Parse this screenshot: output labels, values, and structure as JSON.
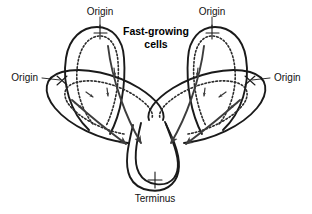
{
  "figure": {
    "title": "Fast-growing cells",
    "caption_terminus": "Terminus",
    "background_color": "#ffffff",
    "stroke_color": "#1a1a1a",
    "dashed_stroke_color": "#2b2b2b",
    "arrow_color": "#3d3d3d"
  },
  "labels": {
    "origin_top_left": "Origin",
    "origin_top_right": "Origin",
    "origin_left": "Origin",
    "origin_right": "Origin",
    "terminus": "Terminus",
    "title_line1": "Fast-growing",
    "title_line2": "cells"
  },
  "diagram_data": {
    "type": "diagram",
    "subject": "Multifork DNA replication in fast-growing bacterial cells",
    "origin_count": 4,
    "terminus_count": 1,
    "replication_bubbles": [
      {
        "name": "top-left-bubble",
        "origin_label": "Origin",
        "orientation": "vertical",
        "outer_strand": "solid",
        "inner_strand": "dashed",
        "fork_arrow_count": 2
      },
      {
        "name": "top-right-bubble",
        "origin_label": "Origin",
        "orientation": "vertical",
        "outer_strand": "solid",
        "inner_strand": "dashed",
        "fork_arrow_count": 2
      },
      {
        "name": "left-bubble",
        "origin_label": "Origin",
        "orientation": "diagonal",
        "outer_strand": "solid",
        "inner_strand": "dashed",
        "fork_arrow_count": 2
      },
      {
        "name": "right-bubble",
        "origin_label": "Origin",
        "orientation": "diagonal",
        "outer_strand": "solid",
        "inner_strand": "dashed",
        "fork_arrow_count": 2
      }
    ],
    "converging_arrows": 4,
    "converge_target": "Terminus"
  }
}
